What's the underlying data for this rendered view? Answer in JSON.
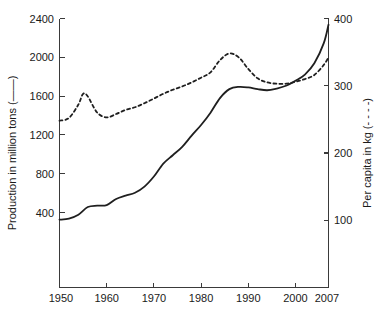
{
  "chart_data": {
    "type": "line",
    "title": "",
    "subtitle": "",
    "xlabel": "",
    "ylabel": "Production in million tons (——)",
    "y2label": "Per capita in kg (- - - -)",
    "xlim": [
      1950,
      2007
    ],
    "ylim": [
      0,
      2400
    ],
    "y2lim": [
      0,
      400
    ],
    "grid": false,
    "legend_position": "in-axis-labels",
    "xticks": [
      1950,
      1960,
      1970,
      1980,
      1990,
      2000,
      2007
    ],
    "xticklabels": [
      "1950",
      "1960",
      "1970",
      "1980",
      "1990",
      "2000",
      "2007"
    ],
    "yticks": [
      400,
      800,
      1200,
      1600,
      2000,
      2400
    ],
    "yticklabels": [
      "400",
      "800",
      "1200",
      "1600",
      "2000",
      "2400"
    ],
    "y2ticks": [
      100,
      200,
      300,
      400
    ],
    "y2ticklabels": [
      "100",
      "200",
      "300",
      "400"
    ],
    "series": [
      {
        "name": "Production in million tons",
        "style": "solid",
        "axis": "left",
        "units": "million tons",
        "x": [
          1950,
          1952,
          1954,
          1956,
          1958,
          1960,
          1962,
          1964,
          1966,
          1968,
          1970,
          1972,
          1974,
          1976,
          1978,
          1980,
          1982,
          1984,
          1986,
          1988,
          1990,
          1992,
          1994,
          1996,
          1998,
          2000,
          2002,
          2004,
          2006,
          2007
        ],
        "values": [
          605,
          615,
          650,
          718,
          730,
          735,
          790,
          820,
          845,
          900,
          990,
          1105,
          1180,
          1255,
          1355,
          1450,
          1560,
          1690,
          1770,
          1790,
          1785,
          1770,
          1760,
          1775,
          1800,
          1845,
          1900,
          2000,
          2180,
          2345
        ]
      },
      {
        "name": "Per capita in kg",
        "style": "dashed",
        "axis": "right",
        "units": "kg",
        "x": [
          1950,
          1952,
          1954,
          1955,
          1956,
          1958,
          1960,
          1962,
          1964,
          1966,
          1968,
          1970,
          1972,
          1974,
          1976,
          1978,
          1980,
          1982,
          1984,
          1986,
          1988,
          1990,
          1992,
          1994,
          1996,
          1998,
          2000,
          2002,
          2004,
          2006,
          2007
        ],
        "values": [
          248,
          252,
          272,
          288,
          284,
          260,
          253,
          258,
          264,
          268,
          274,
          281,
          288,
          294,
          299,
          305,
          312,
          320,
          338,
          348,
          342,
          325,
          311,
          305,
          303,
          303,
          306,
          310,
          316,
          331,
          342
        ]
      }
    ],
    "annotations": []
  }
}
